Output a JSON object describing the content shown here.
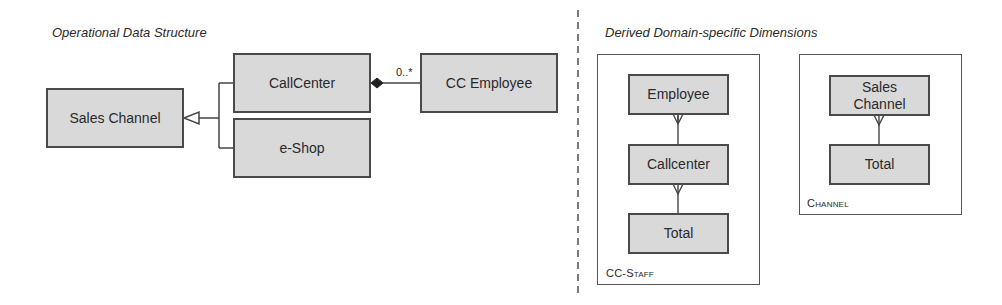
{
  "left_panel": {
    "title": "Operational Data Structure",
    "boxes": {
      "sales_channel": "Sales Channel",
      "callcenter": "CallCenter",
      "eshop": "e-Shop",
      "cc_employee": "CC Employee"
    },
    "relations": [
      {
        "from": "CallCenter",
        "to": "Sales Channel",
        "type": "generalization"
      },
      {
        "from": "e-Shop",
        "to": "Sales Channel",
        "type": "generalization"
      },
      {
        "from": "CallCenter",
        "to": "CC Employee",
        "type": "composition",
        "multiplicity": "0..*"
      }
    ],
    "multiplicity": "0..*"
  },
  "right_panel": {
    "title": "Derived Domain-specific Dimensions",
    "dimensions": [
      {
        "name": "CC-Staff",
        "levels": [
          "Employee",
          "Callcenter",
          "Total"
        ]
      },
      {
        "name": "Channel",
        "levels": [
          "Sales Channel",
          "Total"
        ]
      }
    ]
  },
  "colors": {
    "box_fill": "#d9d9d9",
    "box_border": "#4a4a4a",
    "line": "#444444"
  }
}
